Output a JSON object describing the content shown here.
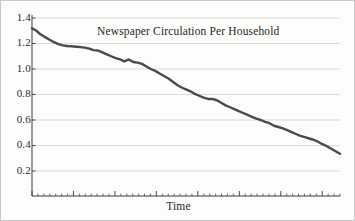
{
  "figure": {
    "background_color": "#fdfdfb",
    "border_color": "#c9c9c9"
  },
  "chart_data": {
    "type": "line",
    "title": "Newspaper Circulation Per Household",
    "xlabel": "Time",
    "ylabel": "",
    "grid": true,
    "legend": false,
    "line_color": "#4a4a4a",
    "line_width": 2.4,
    "ylim": [
      0.0,
      1.45
    ],
    "yticks": [
      1.4,
      1.2,
      1.0,
      0.8,
      0.6,
      0.4,
      0.2
    ],
    "ytick_labels": [
      "1.4",
      "1.2",
      "1.0",
      "0.8",
      "0.6",
      "0.4",
      "0.2"
    ],
    "xlim": [
      0,
      52
    ],
    "xticks_major_count": 9,
    "xticks_minor_count": 52,
    "xtick_labels": [],
    "x": [
      0,
      1,
      2,
      3,
      4,
      5,
      6,
      7,
      8,
      9,
      10,
      11,
      12,
      13,
      14,
      15,
      16,
      17,
      18,
      19,
      20,
      21,
      22,
      23,
      24,
      25,
      26,
      27,
      28,
      29,
      30,
      31,
      32,
      33,
      34,
      35,
      36,
      37,
      38,
      39,
      40,
      41,
      42,
      43,
      44,
      45,
      46,
      47,
      48,
      49,
      50,
      51,
      52
    ],
    "values": [
      1.32,
      1.3,
      1.27,
      1.25,
      1.23,
      1.21,
      1.195,
      1.185,
      1.18,
      1.178,
      1.175,
      1.172,
      1.168,
      1.16,
      1.148,
      1.145,
      1.13,
      1.115,
      1.1,
      1.085,
      1.075,
      1.06,
      1.075,
      1.055,
      1.05,
      1.04,
      1.02,
      1.0,
      0.985,
      0.965,
      0.945,
      0.925,
      0.9,
      0.875,
      0.855,
      0.84,
      0.825,
      0.805,
      0.79,
      0.775,
      0.765,
      0.765,
      0.755,
      0.735,
      0.715,
      0.7,
      0.685,
      0.67,
      0.655,
      0.64,
      0.625,
      0.61,
      0.6
    ]
  },
  "series_tail": {
    "x": [
      53,
      54,
      55,
      56,
      57,
      58,
      59,
      60,
      61,
      62,
      63,
      64,
      65,
      66,
      67,
      68,
      69,
      70
    ],
    "values": [
      0.585,
      0.575,
      0.555,
      0.545,
      0.535,
      0.52,
      0.505,
      0.49,
      0.475,
      0.465,
      0.455,
      0.445,
      0.43,
      0.41,
      0.395,
      0.375,
      0.355,
      0.335
    ]
  }
}
